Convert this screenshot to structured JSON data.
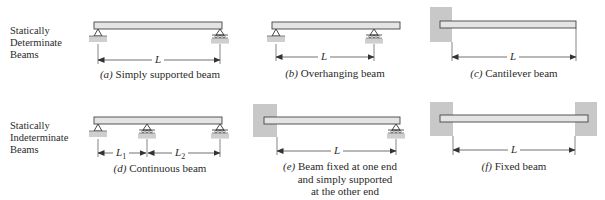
{
  "rows": [
    {
      "label_lines": [
        "Statically",
        "Determinate",
        "Beams"
      ]
    },
    {
      "label_lines": [
        "Statically",
        "Indeterminate",
        "Beams"
      ]
    }
  ],
  "beams": [
    {
      "id": "a",
      "tag": "(a)",
      "caption_lines": [
        "Simply supported beam"
      ],
      "dims": [
        "L"
      ]
    },
    {
      "id": "b",
      "tag": "(b)",
      "caption_lines": [
        "Overhanging beam"
      ],
      "dims": [
        "L"
      ]
    },
    {
      "id": "c",
      "tag": "(c)",
      "caption_lines": [
        "Cantilever beam"
      ],
      "dims": [
        "L"
      ]
    },
    {
      "id": "d",
      "tag": "(d)",
      "caption_lines": [
        "Continuous beam"
      ],
      "dims": [
        "L",
        "L"
      ],
      "dim_subscripts": [
        "1",
        "2"
      ]
    },
    {
      "id": "e",
      "tag": "(e)",
      "caption_lines": [
        "Beam fixed at one end",
        "and simply supported",
        "at the other end"
      ],
      "dims": [
        "L"
      ]
    },
    {
      "id": "f",
      "tag": "(f)",
      "caption_lines": [
        "Fixed beam"
      ],
      "dims": [
        "L"
      ]
    }
  ],
  "colors": {
    "beam_fill": "#e4e4e4",
    "beam_stroke": "#444444",
    "wall_fill": "#c8c8c8",
    "ground_fill": "#cfcfcf",
    "line": "#333333"
  }
}
